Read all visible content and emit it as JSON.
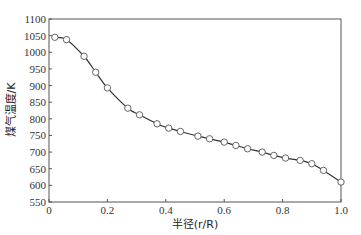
{
  "chart_data": {
    "type": "line",
    "title": "",
    "xlabel": "半径(r/R)",
    "ylabel": "煤气温度/K",
    "xlim": [
      0,
      1.0
    ],
    "ylim": [
      550,
      1100
    ],
    "grid": false,
    "legend": null,
    "x_ticks": [
      "0",
      "0.2",
      "0.4",
      "0.6",
      "0.8",
      "1.0"
    ],
    "y_ticks": [
      "550",
      "600",
      "650",
      "700",
      "750",
      "800",
      "850",
      "900",
      "950",
      "1000",
      "1050",
      "1100"
    ],
    "series": [
      {
        "name": "煤气温度",
        "marker": "open-circle",
        "line": "smooth",
        "x": [
          0.02,
          0.06,
          0.12,
          0.16,
          0.2,
          0.27,
          0.31,
          0.37,
          0.41,
          0.45,
          0.51,
          0.55,
          0.6,
          0.64,
          0.68,
          0.73,
          0.77,
          0.81,
          0.86,
          0.9,
          0.94,
          1.0
        ],
        "values": [
          1045,
          1038,
          988,
          940,
          893,
          832,
          812,
          785,
          772,
          762,
          748,
          740,
          730,
          720,
          710,
          700,
          690,
          682,
          675,
          665,
          645,
          610
        ]
      }
    ]
  },
  "colors": {
    "line": "#333333",
    "axis": "#555555",
    "marker_fill": "#ffffff"
  }
}
